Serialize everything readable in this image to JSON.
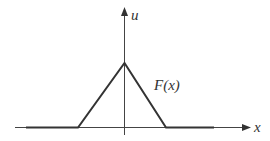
{
  "diagram": {
    "type": "function-graph",
    "axes": {
      "x_label": "x",
      "y_label": "u"
    },
    "curve_label": "F(x)",
    "colors": {
      "line": "#333333",
      "axis": "#333333",
      "background": "#ffffff"
    }
  }
}
